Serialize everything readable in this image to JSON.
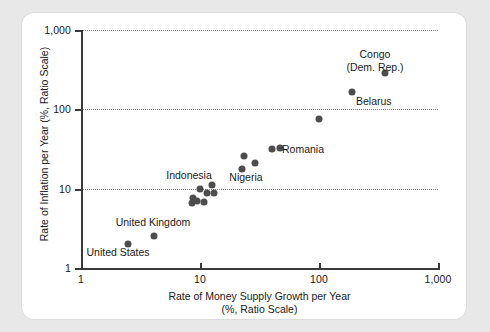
{
  "chart_data": {
    "type": "scatter",
    "title": "",
    "xlabel": "Rate of Money Supply Growth per Year\n(%, Ratio Scale)",
    "xlabel_line1": "Rate of Money Supply Growth per Year",
    "xlabel_line2": "(%, Ratio Scale)",
    "ylabel": "Rate of Inflation per Year (%, Ratio Scale)",
    "xscale": "log",
    "yscale": "log",
    "xlim": [
      1,
      1000
    ],
    "ylim": [
      1,
      1000
    ],
    "grid": "horizontal-dotted",
    "legend": "none",
    "xticks": [
      "1",
      "10",
      "100",
      "1,000"
    ],
    "xtick_values": [
      1,
      10,
      100,
      1000
    ],
    "yticks": [
      "1",
      "10",
      "100",
      "1,000"
    ],
    "ytick_values": [
      1,
      10,
      100,
      1000
    ],
    "marker_color": "#4d4d4d",
    "points": [
      {
        "label": "United States",
        "x": 2.5,
        "y": 2.0
      },
      {
        "label": "United Kingdom",
        "x": 4.1,
        "y": 2.5
      },
      {
        "label": "",
        "x": 8.6,
        "y": 6.6
      },
      {
        "label": "",
        "x": 8.7,
        "y": 7.7
      },
      {
        "label": "",
        "x": 9.5,
        "y": 6.9
      },
      {
        "label": "",
        "x": 10.0,
        "y": 9.9
      },
      {
        "label": "",
        "x": 10.7,
        "y": 6.7
      },
      {
        "label": "Indonesia",
        "x": 11.5,
        "y": 8.9
      },
      {
        "label": "",
        "x": 12.5,
        "y": 11.2
      },
      {
        "label": "",
        "x": 13.0,
        "y": 8.7
      },
      {
        "label": "",
        "x": 22.5,
        "y": 17.5
      },
      {
        "label": "",
        "x": 23.5,
        "y": 26.0
      },
      {
        "label": "Nigeria",
        "x": 29.0,
        "y": 21.0
      },
      {
        "label": "",
        "x": 40.0,
        "y": 32.0
      },
      {
        "label": "Romania",
        "x": 47.0,
        "y": 33.0
      },
      {
        "label": "",
        "x": 100.0,
        "y": 75.0
      },
      {
        "label": "Belarus",
        "x": 190.0,
        "y": 165.0
      },
      {
        "label": "Congo (Dem. Rep.)",
        "x": 360.0,
        "y": 290.0
      }
    ],
    "annotations": [
      {
        "name": "congo-label",
        "text_line1": "Congo",
        "text_line2": "(Dem. Rep.)"
      },
      {
        "name": "belarus-label",
        "text": "Belarus"
      },
      {
        "name": "romania-label",
        "text": "Romania"
      },
      {
        "name": "nigeria-label",
        "text": "Nigeria"
      },
      {
        "name": "indonesia-label",
        "text": "Indonesia"
      },
      {
        "name": "united-kingdom-label",
        "text": "United Kingdom"
      },
      {
        "name": "united-states-label",
        "text": "United States"
      }
    ]
  },
  "axis": {
    "y_title": "Rate of Inflation per Year (%, Ratio Scale)",
    "x_title_line1": "Rate of Money Supply Growth per Year",
    "x_title_line2": "(%, Ratio Scale)",
    "y_ticks": {
      "t1000": "1,000",
      "t100": "100",
      "t10": "10",
      "t1": "1"
    },
    "x_ticks": {
      "t1": "1",
      "t10": "10",
      "t100": "100",
      "t1000": "1,000"
    }
  },
  "labels": {
    "congo_line1": "Congo",
    "congo_line2": "(Dem. Rep.)",
    "belarus": "Belarus",
    "romania": "Romania",
    "nigeria": "Nigeria",
    "indonesia": "Indonesia",
    "united_kingdom": "United Kingdom",
    "united_states": "United States"
  }
}
